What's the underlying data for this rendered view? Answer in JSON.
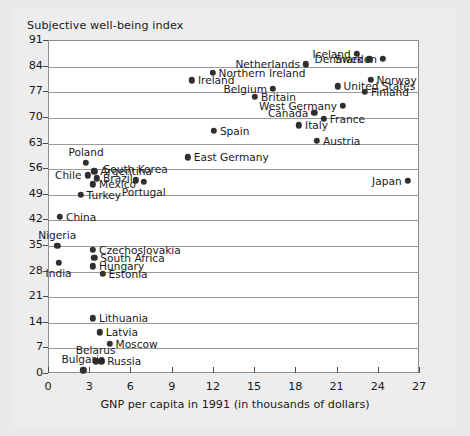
{
  "chart_data": {
    "type": "scatter",
    "title": "Subjective well-being index",
    "xlabel": "GNP per capita in 1991 (in thousands of dollars)",
    "ylabel": "Subjective well-being index",
    "xlim": [
      0,
      27
    ],
    "ylim": [
      0,
      91
    ],
    "xticks": [
      0,
      3,
      6,
      9,
      12,
      15,
      18,
      21,
      24,
      27
    ],
    "yticks": [
      0,
      7,
      14,
      21,
      28,
      35,
      42,
      49,
      56,
      63,
      70,
      77,
      84,
      91
    ],
    "grid": "horizontal",
    "legend": "none",
    "points": [
      {
        "label": "Iceland",
        "x": 22.4,
        "y": 87.5,
        "label_side": "left"
      },
      {
        "label": "Sweden",
        "x": 24.3,
        "y": 86.2,
        "label_side": "left"
      },
      {
        "label": "Denmark",
        "x": 23.3,
        "y": 86.0,
        "label_side": "left"
      },
      {
        "label": "Netherlands",
        "x": 18.7,
        "y": 84.6,
        "label_side": "left"
      },
      {
        "label": "Northern Ireland",
        "x": 11.9,
        "y": 82.3,
        "label_side": "right"
      },
      {
        "label": "Norway",
        "x": 23.4,
        "y": 80.4,
        "label_side": "right"
      },
      {
        "label": "Ireland",
        "x": 10.4,
        "y": 80.3,
        "label_side": "right"
      },
      {
        "label": "United States",
        "x": 21.0,
        "y": 78.6,
        "label_side": "right"
      },
      {
        "label": "Belgium",
        "x": 16.3,
        "y": 78.0,
        "label_side": "left"
      },
      {
        "label": "Finland",
        "x": 23.0,
        "y": 77.1,
        "label_side": "right"
      },
      {
        "label": "Britain",
        "x": 15.0,
        "y": 75.8,
        "label_side": "right"
      },
      {
        "label": "West Germany",
        "x": 21.4,
        "y": 73.2,
        "label_side": "left"
      },
      {
        "label": "Canada",
        "x": 19.3,
        "y": 71.4,
        "label_side": "left"
      },
      {
        "label": "France",
        "x": 20.0,
        "y": 69.8,
        "label_side": "right"
      },
      {
        "label": "Italy",
        "x": 18.2,
        "y": 68.0,
        "label_side": "right"
      },
      {
        "label": "Spain",
        "x": 12.0,
        "y": 66.4,
        "label_side": "right"
      },
      {
        "label": "Austria",
        "x": 19.5,
        "y": 63.8,
        "label_side": "right"
      },
      {
        "label": "East Germany",
        "x": 10.1,
        "y": 59.2,
        "label_side": "right"
      },
      {
        "label": "Poland",
        "x": 2.7,
        "y": 57.8,
        "label_side": "above"
      },
      {
        "label": "Argentina",
        "x": 3.3,
        "y": 55.4,
        "label_side": "right"
      },
      {
        "label": "Chile",
        "x": 2.8,
        "y": 54.3,
        "label_side": "left"
      },
      {
        "label": "Brazil",
        "x": 3.5,
        "y": 53.5,
        "label_side": "right"
      },
      {
        "label": "South Korea",
        "x": 6.3,
        "y": 52.9,
        "label_side": "above"
      },
      {
        "label": "Japan",
        "x": 26.1,
        "y": 52.8,
        "label_side": "left"
      },
      {
        "label": "Mexico",
        "x": 3.2,
        "y": 51.8,
        "label_side": "right"
      },
      {
        "label": "Portugal",
        "x": 6.9,
        "y": 52.6,
        "label_side": "below"
      },
      {
        "label": "Turkey",
        "x": 2.3,
        "y": 49.0,
        "label_side": "right"
      },
      {
        "label": "China",
        "x": 0.8,
        "y": 43.0,
        "label_side": "right"
      },
      {
        "label": "Nigeria",
        "x": 0.6,
        "y": 35.0,
        "label_side": "above"
      },
      {
        "label": "Czechoslovakia",
        "x": 3.2,
        "y": 34.0,
        "label_side": "right"
      },
      {
        "label": "South Africa",
        "x": 3.3,
        "y": 31.8,
        "label_side": "right"
      },
      {
        "label": "India",
        "x": 0.7,
        "y": 30.3,
        "label_side": "below"
      },
      {
        "label": "Hungary",
        "x": 3.2,
        "y": 29.4,
        "label_side": "right"
      },
      {
        "label": "Estonia",
        "x": 3.9,
        "y": 27.4,
        "label_side": "right"
      },
      {
        "label": "Lithuania",
        "x": 3.2,
        "y": 15.2,
        "label_side": "right"
      },
      {
        "label": "Latvia",
        "x": 3.7,
        "y": 11.4,
        "label_side": "right"
      },
      {
        "label": "Moscow",
        "x": 4.4,
        "y": 8.2,
        "label_side": "right"
      },
      {
        "label": "Belarus",
        "x": 3.4,
        "y": 3.5,
        "label_side": "above"
      },
      {
        "label": "Russia",
        "x": 3.8,
        "y": 3.5,
        "label_side": "right"
      },
      {
        "label": "Bulgaria",
        "x": 2.5,
        "y": 1.0,
        "label_side": "above"
      }
    ]
  },
  "colors": {
    "page_background": "#e9e9e9",
    "card_background": "#ededed",
    "plot_background": "#ffffff",
    "gridline": "#9a9a9a",
    "marker": "#2f2f2f",
    "text": "#1a1a1a"
  }
}
